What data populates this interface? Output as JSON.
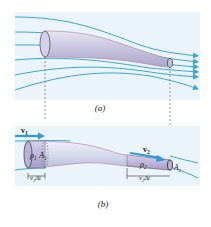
{
  "figure": {
    "panel_a": {
      "caption": "(a)"
    },
    "panel_b": {
      "caption": "(b)",
      "v1": "v",
      "v1_sub": "1",
      "v2": "v",
      "v2_sub": "2",
      "rho1": "ρ",
      "rho1_sub": "1",
      "A1": "A",
      "A1_sub": "1",
      "rho2": "ρ",
      "rho2_sub": "2",
      "A2": "A",
      "A2_sub": "2",
      "dist1": "v",
      "dist1_sub": "1",
      "dist1_suffix": "Δt",
      "dist2": "v",
      "dist2_sub": "2",
      "dist2_suffix": "Δt"
    },
    "colors": {
      "background": "#e8f3fa",
      "streamline": "#3aa6d8",
      "tube": "#c9c6e0",
      "tube_edge": "#b07a9a",
      "arrow": "#2f9ad6"
    }
  }
}
